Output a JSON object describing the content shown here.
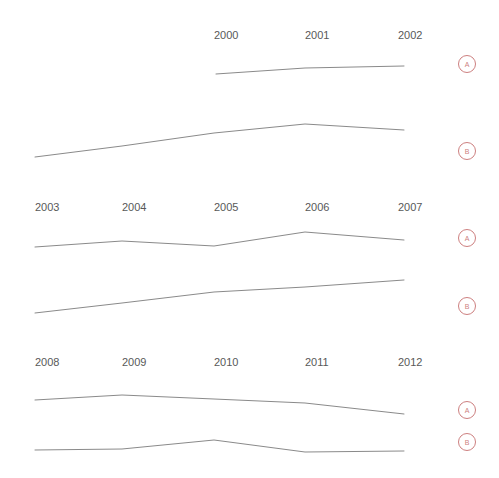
{
  "title_fragment": "",
  "colors": {
    "background": "#ffffff",
    "line": "#8a8a8a",
    "tick_label": "#585858",
    "badge": "#cd7f7f"
  },
  "series_labels": {
    "a": "A",
    "b": "B"
  },
  "chart_data": {
    "type": "line",
    "title": "",
    "xlabel": "",
    "ylabel": "",
    "grid": false,
    "legend_position": "right-inline-badges",
    "layout": "small-multiples-wrapped-rows",
    "x": [
      2000,
      2001,
      2002,
      2003,
      2004,
      2005,
      2006,
      2007,
      2008,
      2009,
      2010,
      2011,
      2012
    ],
    "rows": [
      {
        "row_index": 0,
        "tick_labels": [
          "2000",
          "2001",
          "2002"
        ],
        "tick_x_px": [
          214,
          305,
          398
        ],
        "series": [
          {
            "name": "A",
            "badge": "A",
            "x": [
              2000,
              2001,
              2002
            ],
            "values": [
              74,
              68,
              66
            ],
            "points_px": [
              [
                216,
                74
              ],
              [
                305,
                68
              ],
              [
                404,
                66
              ]
            ]
          },
          {
            "name": "B",
            "badge": "B",
            "x": [
              1998,
              1999,
              2000,
              2001,
              2002
            ],
            "values": [
              157,
              146,
              133,
              124,
              130
            ],
            "points_px": [
              [
                35,
                157
              ],
              [
                122,
                146
              ],
              [
                214,
                133
              ],
              [
                305,
                124
              ],
              [
                404,
                130
              ]
            ]
          }
        ]
      },
      {
        "row_index": 1,
        "tick_labels": [
          "2003",
          "2004",
          "2005",
          "2006",
          "2007"
        ],
        "tick_x_px": [
          35,
          122,
          214,
          305,
          398
        ],
        "series": [
          {
            "name": "A",
            "badge": "A",
            "x": [
              2003,
              2004,
              2005,
              2006,
              2007
            ],
            "values": [
              247,
              241,
              246,
              232,
              240
            ],
            "points_px": [
              [
                35,
                247
              ],
              [
                122,
                241
              ],
              [
                214,
                246
              ],
              [
                305,
                232
              ],
              [
                404,
                240
              ]
            ]
          },
          {
            "name": "B",
            "badge": "B",
            "x": [
              2003,
              2004,
              2005,
              2006,
              2007
            ],
            "values": [
              313,
              303,
              292,
              287,
              280
            ],
            "points_px": [
              [
                35,
                313
              ],
              [
                122,
                303
              ],
              [
                214,
                292
              ],
              [
                305,
                287
              ],
              [
                404,
                280
              ]
            ]
          }
        ]
      },
      {
        "row_index": 2,
        "tick_labels": [
          "2008",
          "2009",
          "2010",
          "2011",
          "2012"
        ],
        "tick_x_px": [
          35,
          122,
          214,
          305,
          398
        ],
        "series": [
          {
            "name": "A",
            "badge": "A",
            "x": [
              2008,
              2009,
              2010,
              2011,
              2012
            ],
            "values": [
              400,
              395,
              399,
              403,
              414
            ],
            "points_px": [
              [
                35,
                400
              ],
              [
                122,
                395
              ],
              [
                214,
                399
              ],
              [
                305,
                403
              ],
              [
                404,
                414
              ]
            ]
          },
          {
            "name": "B",
            "badge": "B",
            "x": [
              2008,
              2009,
              2010,
              2011,
              2012
            ],
            "values": [
              450,
              449,
              440,
              452,
              451
            ],
            "points_px": [
              [
                35,
                450
              ],
              [
                122,
                449
              ],
              [
                214,
                440
              ],
              [
                305,
                452
              ],
              [
                404,
                451
              ]
            ]
          }
        ]
      }
    ],
    "badges": [
      {
        "label": "A",
        "cx": 467,
        "cy": 64
      },
      {
        "label": "B",
        "cx": 467,
        "cy": 151
      },
      {
        "label": "A",
        "cx": 467,
        "cy": 238
      },
      {
        "label": "B",
        "cx": 467,
        "cy": 306
      },
      {
        "label": "A",
        "cx": 467,
        "cy": 410
      },
      {
        "label": "B",
        "cx": 467,
        "cy": 442
      }
    ],
    "tick_rows": [
      {
        "labels": [
          "2000",
          "2001",
          "2002"
        ],
        "x_px": [
          214,
          305,
          398
        ],
        "y_px": 39
      },
      {
        "labels": [
          "2003",
          "2004",
          "2005",
          "2006",
          "2007"
        ],
        "x_px": [
          35,
          122,
          214,
          305,
          398
        ],
        "y_px": 211
      },
      {
        "labels": [
          "2008",
          "2009",
          "2010",
          "2011",
          "2012"
        ],
        "x_px": [
          35,
          122,
          214,
          305,
          398
        ],
        "y_px": 366
      }
    ]
  }
}
